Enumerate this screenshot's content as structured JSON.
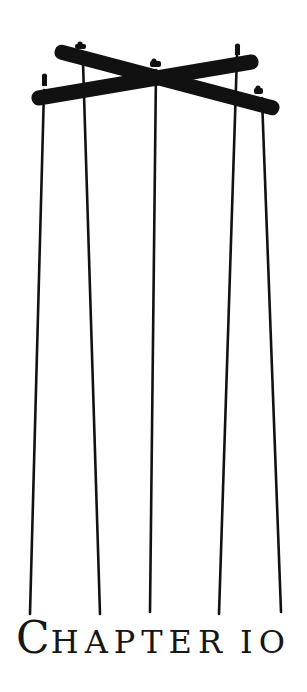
{
  "illustration": {
    "subject": "marionette-control-cross",
    "color": "#111111",
    "string_count": 5
  },
  "title": {
    "initial": "C",
    "rest": "HAPTER",
    "number": "IO",
    "full_text": "CHAPTER 10"
  }
}
